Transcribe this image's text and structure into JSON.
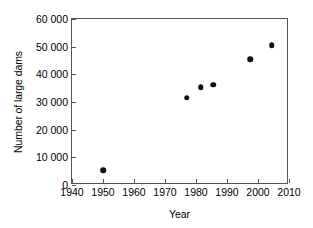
{
  "chart_data": {
    "type": "scatter",
    "title": "",
    "xlabel": "Year",
    "ylabel": "Number of large dams",
    "xlim": [
      1940,
      2010
    ],
    "ylim": [
      0,
      60000
    ],
    "grid": false,
    "legend": null,
    "xticks": [
      1940,
      1950,
      1960,
      1970,
      1980,
      1990,
      2000,
      2010
    ],
    "xtick_labels": [
      "1940",
      "1950",
      "1960",
      "1970",
      "1980",
      "1990",
      "2000",
      "2010"
    ],
    "yticks": [
      0,
      10000,
      20000,
      30000,
      40000,
      50000,
      60000
    ],
    "ytick_labels": [
      "0",
      "10 000",
      "20 000",
      "30 000",
      "40 000",
      "50 000",
      "60 000"
    ],
    "marker": "filled-circle",
    "marker_color": "#111111",
    "points": [
      {
        "x": 1950,
        "y": 5300
      },
      {
        "x": 1977,
        "y": 31500
      },
      {
        "x": 1981.5,
        "y": 35400
      },
      {
        "x": 1985.5,
        "y": 36300
      },
      {
        "x": 1997.5,
        "y": 45500
      },
      {
        "x": 2004.5,
        "y": 50600
      }
    ]
  },
  "axes": {
    "frame_color": "#555555"
  }
}
